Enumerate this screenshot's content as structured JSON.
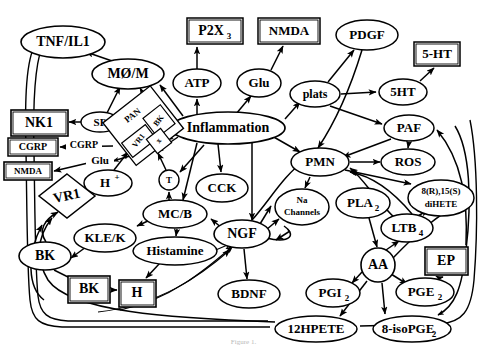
{
  "figure": {
    "caption_partial": "Figure 1.",
    "stroke_color": "#000000",
    "fill_color": "#ffffff",
    "background": "#ffffff"
  },
  "nodes": [
    {
      "id": "tnfil1",
      "label": "TNF/IL1",
      "shape": "ellipse",
      "x": 63,
      "y": 42,
      "rx": 42,
      "ry": 16,
      "fs": 14
    },
    {
      "id": "mom",
      "label": "MØ/M",
      "shape": "ellipse",
      "x": 128,
      "y": 74,
      "rx": 36,
      "ry": 15,
      "fs": 14
    },
    {
      "id": "p2x3",
      "label": "P2X",
      "sub": "3",
      "shape": "rect",
      "x": 215,
      "y": 31,
      "rx": 28,
      "ry": 13,
      "fs": 14
    },
    {
      "id": "atp",
      "label": "ATP",
      "shape": "ellipse",
      "x": 197,
      "y": 83,
      "rx": 24,
      "ry": 14,
      "fs": 13
    },
    {
      "id": "nmda_top",
      "label": "NMDA",
      "shape": "rect",
      "x": 289,
      "y": 31,
      "rx": 31,
      "ry": 13,
      "fs": 13
    },
    {
      "id": "glu_node",
      "label": "Glu",
      "shape": "ellipse",
      "x": 259,
      "y": 83,
      "rx": 22,
      "ry": 14,
      "fs": 13
    },
    {
      "id": "pdgf",
      "label": "PDGF",
      "shape": "ellipse",
      "x": 367,
      "y": 35,
      "rx": 31,
      "ry": 15,
      "fs": 13
    },
    {
      "id": "plats",
      "label": "plats",
      "shape": "ellipse",
      "x": 315,
      "y": 94,
      "rx": 25,
      "ry": 13,
      "fs": 12
    },
    {
      "id": "hthtbox",
      "label": "5-HT",
      "shape": "rect",
      "x": 437,
      "y": 54,
      "rx": 23,
      "ry": 12,
      "fs": 13
    },
    {
      "id": "ht5",
      "label": "5HT",
      "shape": "ellipse",
      "x": 403,
      "y": 92,
      "rx": 24,
      "ry": 13,
      "fs": 13
    },
    {
      "id": "paf",
      "label": "PAF",
      "shape": "ellipse",
      "x": 409,
      "y": 128,
      "rx": 25,
      "ry": 13,
      "fs": 13
    },
    {
      "id": "nk1",
      "label": "NK1",
      "shape": "rect",
      "x": 39,
      "y": 123,
      "rx": 28,
      "ry": 13,
      "fs": 14
    },
    {
      "id": "sp",
      "label": "SP",
      "shape": "ellipse",
      "x": 100,
      "y": 122,
      "rx": 19,
      "ry": 10,
      "fs": 11
    },
    {
      "id": "cgrpbox",
      "label": "CGRP",
      "shape": "rect",
      "x": 33,
      "y": 147,
      "rx": 25,
      "ry": 9,
      "fs": 10
    },
    {
      "id": "nmdabox",
      "label": "NMDA",
      "shape": "rect",
      "x": 28,
      "y": 171,
      "rx": 24,
      "ry": 9,
      "fs": 9
    },
    {
      "id": "inflam",
      "label": "Inflammation",
      "shape": "ellipse",
      "x": 228,
      "y": 128,
      "rx": 57,
      "ry": 16,
      "fs": 14
    },
    {
      "id": "pan",
      "label": "PAN",
      "shape": "diamond",
      "x": 144,
      "y": 125,
      "rx": 30,
      "ry": 30,
      "fs": 9
    },
    {
      "id": "bk_in",
      "label": "BK",
      "shape": "rot-rect",
      "x": 158,
      "y": 121,
      "rx": 11,
      "ry": 14,
      "fs": 8
    },
    {
      "id": "vr1_in",
      "label": "VR1",
      "shape": "rot-rect",
      "x": 140,
      "y": 141,
      "rx": 14,
      "ry": 10,
      "fs": 8
    },
    {
      "id": "x_in",
      "label": "x",
      "shape": "rot-rect",
      "x": 158,
      "y": 141,
      "rx": 9,
      "ry": 9,
      "fs": 8
    },
    {
      "id": "hplus",
      "label": "H",
      "sup": "+",
      "shape": "ellipse",
      "x": 108,
      "y": 183,
      "rx": 24,
      "ry": 13,
      "fs": 13
    },
    {
      "id": "tcirc",
      "label": "T",
      "shape": "circle",
      "x": 169,
      "y": 180,
      "rx": 10,
      "ry": 10,
      "fs": 9
    },
    {
      "id": "vr1",
      "label": "VR1",
      "shape": "diamond",
      "x": 67,
      "y": 196,
      "rx": 28,
      "ry": 22,
      "fs": 14
    },
    {
      "id": "pmn",
      "label": "PMN",
      "shape": "ellipse",
      "x": 320,
      "y": 162,
      "rx": 29,
      "ry": 14,
      "fs": 13
    },
    {
      "id": "ros",
      "label": "ROS",
      "shape": "ellipse",
      "x": 408,
      "y": 162,
      "rx": 27,
      "ry": 13,
      "fs": 13
    },
    {
      "id": "dihete",
      "label": "8(R),15(S)",
      "label2": "diHETE",
      "shape": "ellipse",
      "x": 441,
      "y": 198,
      "rx": 33,
      "ry": 18,
      "fs": 9
    },
    {
      "id": "cck",
      "label": "CCK",
      "shape": "ellipse",
      "x": 222,
      "y": 188,
      "rx": 26,
      "ry": 14,
      "fs": 13
    },
    {
      "id": "nachan",
      "label": "Na",
      "label2": "Channels",
      "shape": "ellipse",
      "x": 302,
      "y": 207,
      "rx": 27,
      "ry": 18,
      "fs": 9
    },
    {
      "id": "pla2",
      "label": "PLA",
      "sub": "2",
      "shape": "ellipse",
      "x": 363,
      "y": 203,
      "rx": 27,
      "ry": 15,
      "fs": 13
    },
    {
      "id": "ltb4",
      "label": "LTB",
      "sub": "4",
      "shape": "ellipse",
      "x": 407,
      "y": 228,
      "rx": 26,
      "ry": 14,
      "fs": 13
    },
    {
      "id": "mcb",
      "label": "MC/B",
      "shape": "ellipse",
      "x": 175,
      "y": 214,
      "rx": 32,
      "ry": 14,
      "fs": 13
    },
    {
      "id": "klek",
      "label": "KLE/K",
      "shape": "ellipse",
      "x": 105,
      "y": 238,
      "rx": 31,
      "ry": 14,
      "fs": 13
    },
    {
      "id": "histamine",
      "label": "Histamine",
      "shape": "ellipse",
      "x": 175,
      "y": 251,
      "rx": 42,
      "ry": 14,
      "fs": 13
    },
    {
      "id": "bk_ell",
      "label": "BK",
      "shape": "ellipse",
      "x": 45,
      "y": 256,
      "rx": 26,
      "ry": 14,
      "fs": 14
    },
    {
      "id": "bk_box",
      "label": "BK",
      "shape": "rect",
      "x": 89,
      "y": 289,
      "rx": 21,
      "ry": 13,
      "fs": 14
    },
    {
      "id": "h_box",
      "label": "H",
      "shape": "rect",
      "x": 137,
      "y": 293,
      "rx": 18,
      "ry": 13,
      "fs": 14
    },
    {
      "id": "ngf",
      "label": "NGF",
      "shape": "ellipse",
      "x": 242,
      "y": 234,
      "rx": 28,
      "ry": 14,
      "fs": 14
    },
    {
      "id": "bdnf",
      "label": "BDNF",
      "shape": "ellipse",
      "x": 249,
      "y": 294,
      "rx": 31,
      "ry": 14,
      "fs": 13
    },
    {
      "id": "aa",
      "label": "AA",
      "shape": "circle",
      "x": 378,
      "y": 265,
      "rx": 17,
      "ry": 17,
      "fs": 14
    },
    {
      "id": "ep",
      "label": "EP",
      "shape": "rect",
      "x": 446,
      "y": 261,
      "rx": 21,
      "ry": 14,
      "fs": 14
    },
    {
      "id": "pgi2",
      "label": "PGI",
      "sub": "2",
      "shape": "ellipse",
      "x": 333,
      "y": 293,
      "rx": 27,
      "ry": 14,
      "fs": 13
    },
    {
      "id": "pge2",
      "label": "PGE",
      "sub": "2",
      "shape": "ellipse",
      "x": 425,
      "y": 292,
      "rx": 29,
      "ry": 14,
      "fs": 13
    },
    {
      "id": "hpete12",
      "label": "12HPETE",
      "shape": "ellipse",
      "x": 316,
      "y": 329,
      "rx": 41,
      "ry": 13,
      "fs": 13
    },
    {
      "id": "isopge",
      "label": "8-isoPGE",
      "sub": "2",
      "shape": "ellipse",
      "x": 412,
      "y": 329,
      "rx": 39,
      "ry": 13,
      "fs": 13
    }
  ],
  "edge_labels": [
    {
      "id": "lbl_sp",
      "text": "SP",
      "x": 100,
      "y": 122
    },
    {
      "id": "lbl_cgrp",
      "text": "CGRP",
      "x": 84,
      "y": 146
    },
    {
      "id": "lbl_glu",
      "text": "Glu",
      "x": 100,
      "y": 161
    }
  ],
  "edges": [
    {
      "from": "mom",
      "to": "tnfil1",
      "type": "arrow"
    },
    {
      "from": "sp",
      "to": "mom",
      "type": "arrow"
    },
    {
      "from": "pan",
      "to": "mom",
      "type": "arrow"
    },
    {
      "from": "inflam",
      "to": "mom",
      "type": "arrow"
    },
    {
      "from": "atp",
      "to": "p2x3",
      "type": "arrow"
    },
    {
      "from": "inflam",
      "to": "atp",
      "type": "arrow"
    },
    {
      "from": "glu_node",
      "to": "nmda_top",
      "type": "arrow"
    },
    {
      "from": "inflam",
      "to": "glu_node",
      "type": "arrow"
    },
    {
      "from": "plats",
      "to": "pdgf",
      "type": "arrow"
    },
    {
      "from": "pdgf",
      "to": "pmn",
      "type": "arrow"
    },
    {
      "from": "inflam",
      "to": "plats",
      "type": "arrow"
    },
    {
      "from": "plats",
      "to": "ht5",
      "type": "arrow"
    },
    {
      "from": "plats",
      "to": "paf",
      "type": "arrow"
    },
    {
      "from": "ht5",
      "to": "hthtbox",
      "type": "arrow"
    },
    {
      "from": "paf",
      "to": "pmn",
      "type": "arrow"
    },
    {
      "from": "paf",
      "to": "ros",
      "type": "arrow"
    },
    {
      "from": "sp",
      "to": "nk1",
      "type": "arrow"
    },
    {
      "from": "pan",
      "to": "sp",
      "type": "arrow"
    },
    {
      "from": "pan",
      "to": "cgrpbox",
      "type": "arrow",
      "label": "CGRP"
    },
    {
      "from": "pan",
      "to": "nmdabox",
      "type": "arrow",
      "label": "Glu"
    },
    {
      "from": "inflam",
      "to": "pan",
      "type": "arrow"
    },
    {
      "from": "hplus",
      "to": "pan",
      "type": "arrow"
    },
    {
      "from": "hplus",
      "to": "vr1",
      "type": "arrow"
    },
    {
      "from": "inflam",
      "to": "tcirc",
      "type": "arrow"
    },
    {
      "from": "tcirc",
      "to": "pan",
      "type": "arrow"
    },
    {
      "from": "mcb",
      "to": "tcirc",
      "type": "arrow"
    },
    {
      "from": "inflam",
      "to": "cck",
      "type": "arrow"
    },
    {
      "from": "inflam",
      "to": "pmn",
      "type": "arrow"
    },
    {
      "from": "inflam",
      "to": "mcb",
      "type": "arrow"
    },
    {
      "from": "inflam",
      "to": "ngf",
      "type": "arrow"
    },
    {
      "from": "pmn",
      "to": "ros",
      "type": "arrow"
    },
    {
      "from": "pmn",
      "to": "dihete",
      "type": "arrow"
    },
    {
      "from": "pmn",
      "to": "nachan",
      "type": "arrow"
    },
    {
      "from": "ltb4",
      "to": "pmn",
      "type": "arrow"
    },
    {
      "from": "dihete",
      "to": "pmn",
      "type": "arrow"
    },
    {
      "from": "pla2",
      "to": "aa",
      "type": "arrow"
    },
    {
      "from": "aa",
      "to": "ltb4",
      "type": "arrow"
    },
    {
      "from": "ltb4",
      "to": "dihete",
      "type": "arrow"
    },
    {
      "from": "aa",
      "to": "pgi2",
      "type": "arrow"
    },
    {
      "from": "aa",
      "to": "pge2",
      "type": "arrow"
    },
    {
      "from": "aa",
      "to": "hpete12",
      "type": "arrow"
    },
    {
      "from": "aa",
      "to": "isopge",
      "type": "arrow"
    },
    {
      "from": "pge2",
      "to": "ep",
      "type": "arrow"
    },
    {
      "from": "cck",
      "to": "ngf",
      "type": "arrow"
    },
    {
      "from": "ngf",
      "to": "mcb",
      "type": "arrow"
    },
    {
      "from": "ngf",
      "to": "bdnf",
      "type": "arrow"
    },
    {
      "from": "ngf",
      "to": "nachan",
      "type": "arrow"
    },
    {
      "from": "ngf",
      "to": "pan",
      "type": "arrow"
    },
    {
      "from": "mcb",
      "to": "klek",
      "type": "arrow"
    },
    {
      "from": "mcb",
      "to": "histamine",
      "type": "arrow"
    },
    {
      "from": "klek",
      "to": "bk_ell",
      "type": "arrow"
    },
    {
      "from": "bk_ell",
      "to": "bk_box",
      "type": "arrow"
    },
    {
      "from": "bk_box",
      "to": "h_box",
      "type": "arrow"
    },
    {
      "from": "histamine",
      "to": "h_box",
      "type": "arrow"
    },
    {
      "from": "bk_ell",
      "to": "vr1",
      "type": "arrow"
    },
    {
      "from": "hpete12",
      "to": "vr1",
      "type": "arrow"
    },
    {
      "from": "isopge",
      "to": "ep",
      "type": "arrow"
    },
    {
      "from": "histamine",
      "to": "ngf",
      "type": "arrow"
    },
    {
      "from": "tnfil1",
      "to": "nk1",
      "type": "line"
    }
  ]
}
